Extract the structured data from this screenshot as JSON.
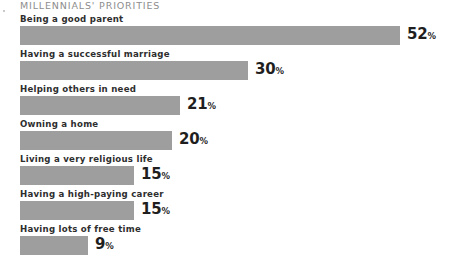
{
  "chart_data": {
    "type": "bar",
    "orientation": "horizontal",
    "title": "MILLENNIALS' PRIORITIES",
    "xlabel": "",
    "ylabel": "",
    "xlim": [
      0,
      60
    ],
    "grid": false,
    "legend": null,
    "value_suffix": "%",
    "bar_color": "#9e9e9e",
    "categories": [
      "Being a good parent",
      "Having a successful marriage",
      "Helping others in need",
      "Owning a home",
      "Living a very religious life",
      "Having a high-paying career",
      "Having lots of free time"
    ],
    "values": [
      52,
      30,
      21,
      20,
      15,
      15,
      9
    ],
    "value_labels": [
      "52",
      "30",
      "21",
      "20",
      "15",
      "15",
      "9"
    ]
  },
  "rows": [
    {
      "label": "Being a good parent",
      "value": "52",
      "pct": "%",
      "bar_px": 380
    },
    {
      "label": "Having a successful marriage",
      "value": "30",
      "pct": "%",
      "bar_px": 228
    },
    {
      "label": "Helping others in need",
      "value": "21",
      "pct": "%",
      "bar_px": 160
    },
    {
      "label": "Owning a home",
      "value": "20",
      "pct": "%",
      "bar_px": 152
    },
    {
      "label": "Living a very religious life",
      "value": "15",
      "pct": "%",
      "bar_px": 114
    },
    {
      "label": "Having a high-paying career",
      "value": "15",
      "pct": "%",
      "bar_px": 114
    },
    {
      "label": "Having lots of free time",
      "value": "9",
      "pct": "%",
      "bar_px": 68
    }
  ]
}
